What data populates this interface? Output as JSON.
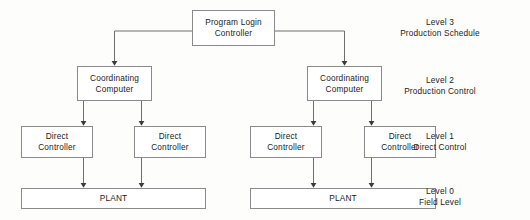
{
  "diagram": {
    "colors": {
      "background": "#fdfdfc",
      "box_fill": "#ffffff",
      "box_border": "#8a8a8a",
      "connector": "#6e6e6e",
      "text": "#1b1b1b"
    },
    "nodes": [
      {
        "id": "program-login-controller",
        "label": "Program Login\nController",
        "x": 192,
        "y": 10,
        "w": 83,
        "h": 36
      },
      {
        "id": "coordinating-computer-left",
        "label": "Coordinating\nComputer",
        "x": 77,
        "y": 66,
        "w": 75,
        "h": 35
      },
      {
        "id": "coordinating-computer-right",
        "label": "Coordinating\nComputer",
        "x": 307,
        "y": 66,
        "w": 75,
        "h": 35
      },
      {
        "id": "direct-controller-1",
        "label": "Direct\nController",
        "x": 21,
        "y": 126,
        "w": 72,
        "h": 32
      },
      {
        "id": "direct-controller-2",
        "label": "Direct\nController",
        "x": 134,
        "y": 126,
        "w": 72,
        "h": 32
      },
      {
        "id": "direct-controller-3",
        "label": "Direct\nController",
        "x": 250,
        "y": 126,
        "w": 72,
        "h": 32
      },
      {
        "id": "direct-controller-4",
        "label": "Direct\nController",
        "x": 364,
        "y": 126,
        "w": 72,
        "h": 32
      },
      {
        "id": "plant-left",
        "label": "PLANT",
        "x": 21,
        "y": 188,
        "w": 185,
        "h": 21
      },
      {
        "id": "plant-right",
        "label": "PLANT",
        "x": 250,
        "y": 188,
        "w": 186,
        "h": 21
      }
    ],
    "levels": [
      {
        "id": "level-3",
        "line1": "Level 3",
        "line2": "Production Schedule",
        "x": 440,
        "y": 17
      },
      {
        "id": "level-2",
        "line1": "Level 2",
        "line2": "Production Control",
        "x": 440,
        "y": 75
      },
      {
        "id": "level-1",
        "line1": "Level 1",
        "line2": "Direct Control",
        "x": 440,
        "y": 131
      },
      {
        "id": "level-0",
        "line1": "Level 0",
        "line2": "Field Level",
        "x": 440,
        "y": 186
      }
    ],
    "connectors": [
      {
        "id": "login-to-coord-left",
        "from": "program-login-controller",
        "to": "coordinating-computer-left",
        "path": "M 192 31 L 114.5 31 L 114.5 62"
      },
      {
        "id": "login-to-coord-right",
        "from": "program-login-controller",
        "to": "coordinating-computer-right",
        "path": "M 275 31 L 344.5 31 L 344.5 62"
      },
      {
        "id": "coord-left-to-dc1",
        "from": "coordinating-computer-left",
        "to": "direct-controller-1",
        "path": "M 83.5 101 L 83.5 122"
      },
      {
        "id": "coord-left-to-dc2",
        "from": "coordinating-computer-left",
        "to": "direct-controller-2",
        "path": "M 141.5 101 L 141.5 122"
      },
      {
        "id": "coord-right-to-dc3",
        "from": "coordinating-computer-right",
        "to": "direct-controller-3",
        "path": "M 313.5 101 L 313.5 122"
      },
      {
        "id": "coord-right-to-dc4",
        "from": "coordinating-computer-right",
        "to": "direct-controller-4",
        "path": "M 371.5 101 L 371.5 122"
      },
      {
        "id": "dc1-to-plant-left",
        "from": "direct-controller-1",
        "to": "plant-left",
        "path": "M 83.5 158 L 83.5 184"
      },
      {
        "id": "dc2-to-plant-left",
        "from": "direct-controller-2",
        "to": "plant-left",
        "path": "M 141.5 158 L 141.5 184"
      },
      {
        "id": "dc3-to-plant-right",
        "from": "direct-controller-3",
        "to": "plant-right",
        "path": "M 313.5 158 L 313.5 184"
      },
      {
        "id": "dc4-to-plant-right",
        "from": "direct-controller-4",
        "to": "plant-right",
        "path": "M 371.5 158 L 371.5 184"
      }
    ]
  }
}
